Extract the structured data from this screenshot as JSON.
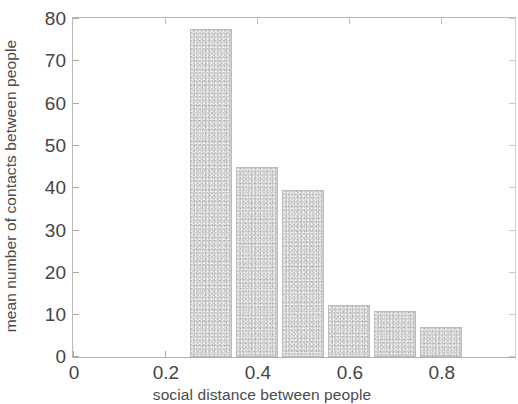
{
  "chart_data": {
    "type": "bar",
    "title": "",
    "xlabel": "social distance between people",
    "ylabel": "mean number of contacts between people",
    "categories": [
      "0.3",
      "0.4",
      "0.5",
      "0.6",
      "0.7",
      "0.8"
    ],
    "x": [
      0.3,
      0.4,
      0.5,
      0.6,
      0.7,
      0.8
    ],
    "values": [
      77.5,
      45,
      39.5,
      12.3,
      10.8,
      7.1
    ],
    "bar_width": 0.09,
    "xlim": [
      0,
      0.96
    ],
    "ylim": [
      0,
      80
    ],
    "xticks": [
      0,
      0.2,
      0.4,
      0.6,
      0.8
    ],
    "xtick_labels": [
      "0",
      "0.2",
      "0.4",
      "0.6",
      "0.8"
    ],
    "yticks": [
      0,
      10,
      20,
      30,
      40,
      50,
      60,
      70,
      80
    ],
    "ytick_labels": [
      "0",
      "10",
      "20",
      "30",
      "40",
      "50",
      "60",
      "70",
      "80"
    ],
    "grid": false,
    "legend": null,
    "bar_color": "#cdcdcd",
    "axis_color": "#b9b9b9",
    "text_color": "#444444"
  }
}
